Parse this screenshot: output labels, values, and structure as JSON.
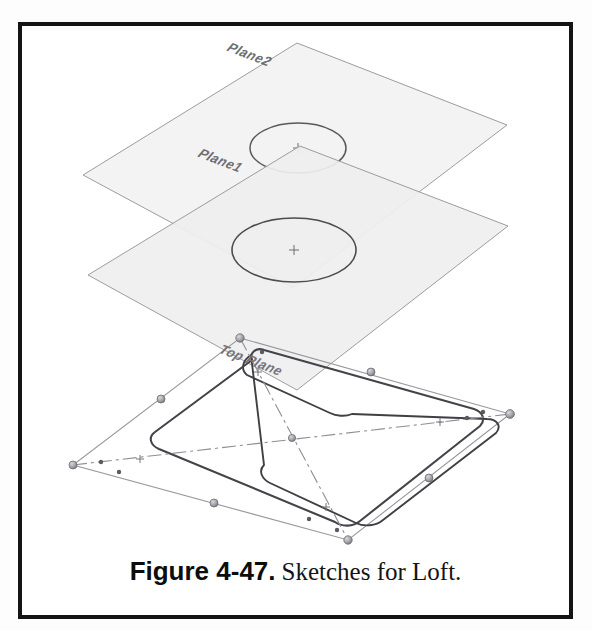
{
  "figure": {
    "number_label": "Figure 4-47.",
    "description": "Sketches for Loft.",
    "frame_color": "#141414",
    "background_color": "#ffffff"
  },
  "cad_view": {
    "application_style": "solidworks-sketch-viewport",
    "planes": [
      {
        "name": "Plane2",
        "label": "Plane2",
        "role": "upper-reference-plane",
        "fill_color": "#f2f2f2",
        "edge_color": "#9a9a9e",
        "corners": [
          [
            297,
            43
          ],
          [
            507,
            125
          ],
          [
            293,
            288
          ],
          [
            83,
            175
          ]
        ],
        "sketch": {
          "type": "circle",
          "center": [
            298,
            148
          ],
          "rx": 48,
          "ry": 25,
          "stroke_color": "#5b5b60"
        }
      },
      {
        "name": "Plane1",
        "label": "Plane1",
        "role": "middle-reference-plane",
        "fill_color": "#efefef",
        "edge_color": "#9a9a9e",
        "corners": [
          [
            300,
            146
          ],
          [
            508,
            226
          ],
          [
            297,
            390
          ],
          [
            88,
            275
          ]
        ],
        "sketch": {
          "type": "circle",
          "center": [
            294,
            250
          ],
          "rx": 62,
          "ry": 32,
          "stroke_color": "#4e4e53"
        }
      },
      {
        "name": "Top Plane",
        "label": "Top Plane",
        "role": "base-sketch-plane",
        "fill_color": "none",
        "edge_color": "#8d8d92",
        "corners": [
          [
            240,
            338
          ],
          [
            510,
            414
          ],
          [
            348,
            540
          ],
          [
            73,
            465
          ]
        ],
        "sketch": {
          "type": "rounded-rectangle",
          "stroke_color": "#3f3f44",
          "corner_radius_hint": "filleted"
        }
      }
    ],
    "construction_geometry": {
      "type": "centerlines",
      "style": "dash-dot",
      "color": "#8a8a90",
      "lines": [
        {
          "from": [
            240,
            338
          ],
          "to": [
            348,
            540
          ]
        },
        {
          "from": [
            73,
            465
          ],
          "to": [
            510,
            414
          ]
        }
      ],
      "midpoint_marks": [
        "+",
        "+",
        "+",
        "+"
      ]
    },
    "sketch_points": {
      "color": "#8e8e94",
      "highlight_color": "#b9b9bf",
      "count": 12
    },
    "center_marks": {
      "glyph": "+",
      "color": "#6a6a70",
      "positions": [
        [
          298,
          148
        ],
        [
          294,
          250
        ],
        [
          291,
          439
        ]
      ]
    }
  }
}
